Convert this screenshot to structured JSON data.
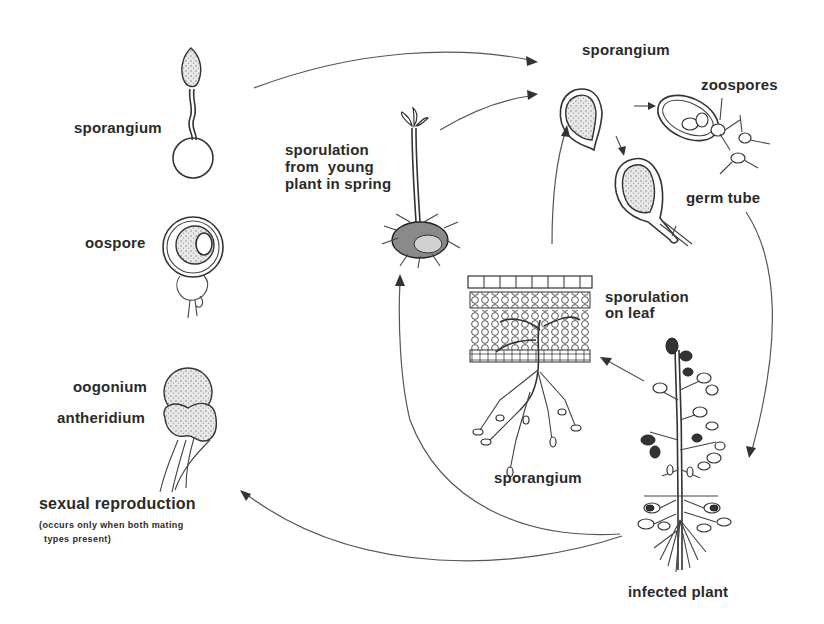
{
  "labels": {
    "sporangium_left": "sporangium",
    "oospore": "oospore",
    "oogonium": "oogonium",
    "antheridium": "antheridium",
    "sexual_reproduction": "sexual reproduction",
    "sexual_note_line1": "(occurs only when both mating",
    "sexual_note_line2": "types present)",
    "sporulation_young_plant": "sporulation\nfrom  young\nplant in spring",
    "sporangium_top": "sporangium",
    "zoospores": "zoospores",
    "germ_tube": "germ tube",
    "sporulation_on_leaf": "sporulation\non leaf",
    "sporangium_bottom": "sporangium",
    "infected_plant": "infected  plant"
  },
  "cycle_stages": [
    "sporangium (germinating oospore)",
    "oospore",
    "oogonium + antheridium",
    "sexual reproduction",
    "sporulation from young plant in spring",
    "sporangium",
    "zoospores",
    "germ tube",
    "infected plant",
    "sporulation on leaf",
    "sporangium"
  ],
  "colors": {
    "ink": "#333333",
    "background": "#ffffff"
  }
}
